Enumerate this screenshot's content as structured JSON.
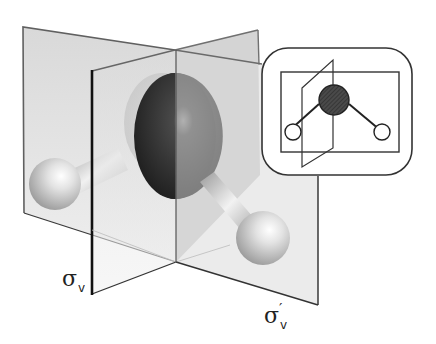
{
  "figure": {
    "colors": {
      "plane_fill": "#d9d9d9",
      "plane_edge": "#555555",
      "front_edge": "#111111",
      "oxygen": "#333333",
      "hydrogen": "#e6e6e6",
      "inset_stroke": "#333333"
    },
    "labels": {
      "sigma_v": {
        "symbol": "σ",
        "subscript": "v",
        "prime": ""
      },
      "sigma_v_prime": {
        "symbol": "σ",
        "subscript": "v",
        "prime": "′"
      }
    },
    "inset": {
      "title": "schematic of water molecule with mirror planes",
      "atoms": [
        "O (shaded, center)",
        "H (left)",
        "H (right)"
      ]
    }
  }
}
